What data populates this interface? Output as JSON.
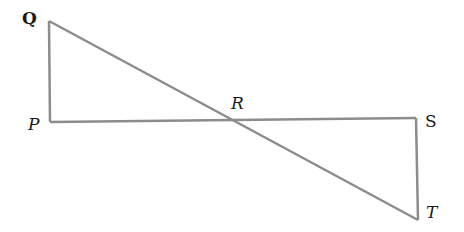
{
  "diagram": {
    "line_color": "#8c8c8c",
    "points": {
      "Q": {
        "label": "Q",
        "x": 49,
        "y": 21
      },
      "P": {
        "label": "P",
        "x": 50,
        "y": 122
      },
      "R": {
        "label": "R",
        "x": 232,
        "y": 121
      },
      "S": {
        "label": "S",
        "x": 416,
        "y": 118
      },
      "T": {
        "label": "T",
        "x": 418,
        "y": 220
      }
    },
    "segments": [
      "QP",
      "PS",
      "QT",
      "ST"
    ]
  }
}
